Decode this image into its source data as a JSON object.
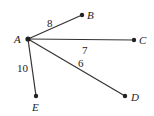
{
  "graph": {
    "nodes": [
      {
        "id": "A",
        "label": "A",
        "x": 28,
        "y": 39,
        "lx": 14,
        "ly": 43
      },
      {
        "id": "B",
        "label": "B",
        "x": 82,
        "y": 15,
        "lx": 87,
        "ly": 19
      },
      {
        "id": "C",
        "label": "C",
        "x": 134,
        "y": 40,
        "lx": 139,
        "ly": 44
      },
      {
        "id": "D",
        "label": "D",
        "x": 125,
        "y": 96,
        "lx": 131,
        "ly": 101
      },
      {
        "id": "E",
        "label": "E",
        "x": 36,
        "y": 96,
        "lx": 32,
        "ly": 111
      }
    ],
    "edges": [
      {
        "from": "A",
        "to": "B",
        "weight": "8",
        "lx": 47,
        "ly": 27
      },
      {
        "from": "A",
        "to": "C",
        "weight": "7",
        "lx": 82,
        "ly": 54
      },
      {
        "from": "A",
        "to": "D",
        "weight": "6",
        "lx": 78,
        "ly": 67
      },
      {
        "from": "A",
        "to": "E",
        "weight": "10",
        "lx": 17,
        "ly": 72
      }
    ]
  }
}
